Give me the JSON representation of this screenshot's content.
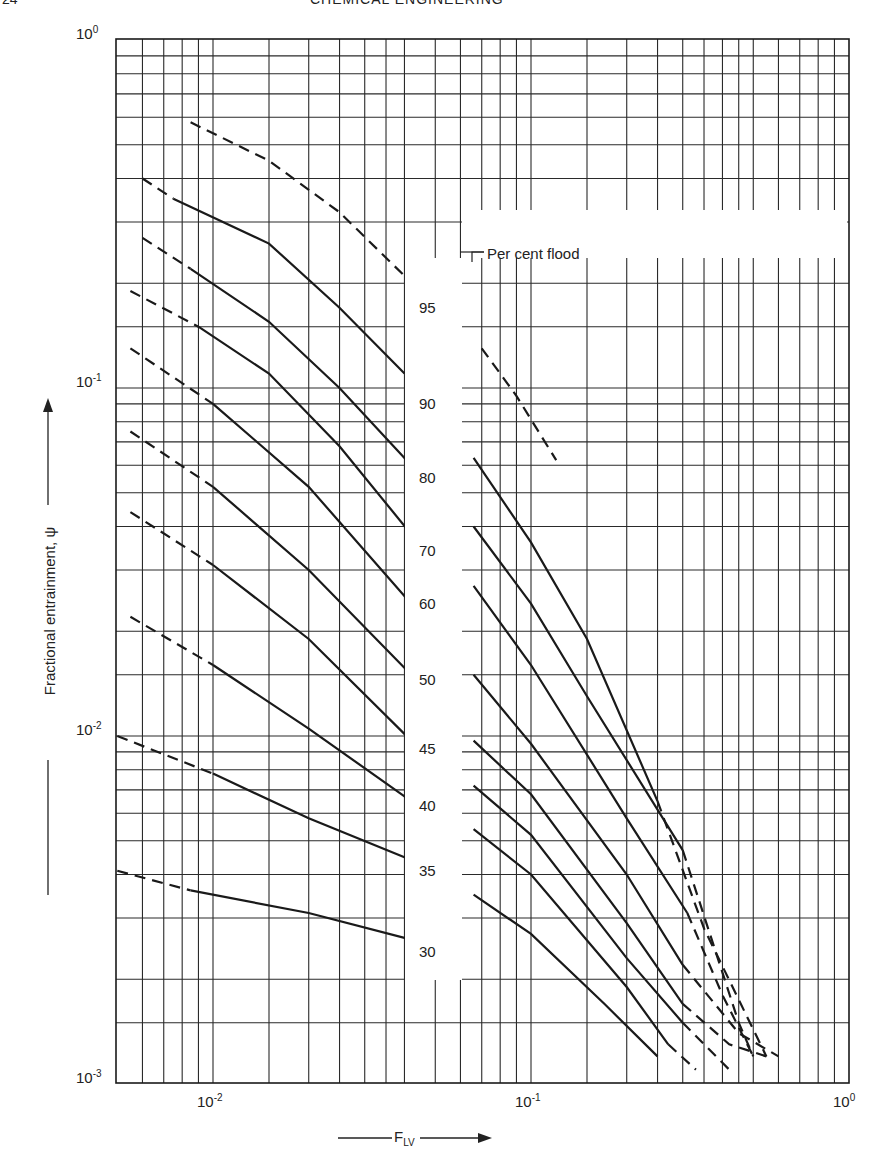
{
  "header": {
    "page_number": "24",
    "running_title": "CHEMICAL ENGINEERING"
  },
  "chart_data": {
    "type": "line",
    "title": "",
    "xlabel": "F_LV",
    "ylabel": "Fractional entrainment, ψ",
    "xscale": "log",
    "yscale": "log",
    "xlim": [
      0.005,
      1.0
    ],
    "ylim": [
      0.001,
      1.0
    ],
    "x_tick_labels": [
      "10^-2",
      "10^-1",
      "10^0"
    ],
    "y_tick_labels": [
      "10^0",
      "10^-1",
      "10^-2",
      "10^-3"
    ],
    "grid": true,
    "legend_title": "Per cent flood",
    "series": [
      {
        "name": "95",
        "segments": [
          {
            "style": "dashed",
            "points": [
              [
                0.0085,
                0.58
              ],
              [
                0.015,
                0.45
              ],
              [
                0.025,
                0.32
              ],
              [
                0.04,
                0.21
              ]
            ]
          },
          {
            "style": "dashed",
            "points": [
              [
                0.07,
                0.13
              ],
              [
                0.09,
                0.095
              ],
              [
                0.12,
                0.062
              ]
            ]
          }
        ]
      },
      {
        "name": "90",
        "segments": [
          {
            "style": "dashed",
            "points": [
              [
                0.006,
                0.4
              ],
              [
                0.0075,
                0.35
              ]
            ]
          },
          {
            "style": "solid",
            "points": [
              [
                0.0075,
                0.35
              ],
              [
                0.015,
                0.26
              ],
              [
                0.025,
                0.17
              ],
              [
                0.04,
                0.11
              ]
            ]
          }
        ]
      },
      {
        "name": "80",
        "segments": [
          {
            "style": "dashed",
            "points": [
              [
                0.006,
                0.27
              ],
              [
                0.0085,
                0.22
              ]
            ]
          },
          {
            "style": "solid",
            "points": [
              [
                0.0085,
                0.22
              ],
              [
                0.015,
                0.155
              ],
              [
                0.025,
                0.1
              ],
              [
                0.042,
                0.06
              ]
            ]
          },
          {
            "style": "solid",
            "points": [
              [
                0.066,
                0.063
              ],
              [
                0.1,
                0.036
              ],
              [
                0.15,
                0.019
              ],
              [
                0.25,
                0.0065
              ]
            ]
          },
          {
            "style": "dashed",
            "points": [
              [
                0.25,
                0.0065
              ],
              [
                0.35,
                0.0028
              ],
              [
                0.55,
                0.0012
              ]
            ]
          }
        ]
      },
      {
        "name": "70",
        "segments": [
          {
            "style": "dashed",
            "points": [
              [
                0.0055,
                0.19
              ],
              [
                0.009,
                0.15
              ]
            ]
          },
          {
            "style": "solid",
            "points": [
              [
                0.009,
                0.15
              ],
              [
                0.015,
                0.11
              ],
              [
                0.025,
                0.068
              ],
              [
                0.042,
                0.038
              ]
            ]
          },
          {
            "style": "solid",
            "points": [
              [
                0.066,
                0.04
              ],
              [
                0.1,
                0.024
              ],
              [
                0.15,
                0.013
              ],
              [
                0.3,
                0.0047
              ]
            ]
          },
          {
            "style": "dashed",
            "points": [
              [
                0.3,
                0.0047
              ],
              [
                0.45,
                0.0015
              ],
              [
                0.5,
                0.0012
              ]
            ]
          }
        ]
      },
      {
        "name": "60",
        "segments": [
          {
            "style": "dashed",
            "points": [
              [
                0.0055,
                0.13
              ],
              [
                0.01,
                0.09
              ]
            ]
          },
          {
            "style": "solid",
            "points": [
              [
                0.01,
                0.09
              ],
              [
                0.02,
                0.052
              ],
              [
                0.042,
                0.024
              ]
            ]
          },
          {
            "style": "solid",
            "points": [
              [
                0.066,
                0.027
              ],
              [
                0.1,
                0.016
              ],
              [
                0.2,
                0.0058
              ],
              [
                0.31,
                0.0031
              ]
            ]
          },
          {
            "style": "dashed",
            "points": [
              [
                0.31,
                0.0031
              ],
              [
                0.4,
                0.0018
              ],
              [
                0.5,
                0.0012
              ]
            ]
          }
        ]
      },
      {
        "name": "50",
        "segments": [
          {
            "style": "dashed",
            "points": [
              [
                0.0055,
                0.075
              ],
              [
                0.01,
                0.052
              ]
            ]
          },
          {
            "style": "solid",
            "points": [
              [
                0.01,
                0.052
              ],
              [
                0.02,
                0.03
              ],
              [
                0.042,
                0.015
              ]
            ]
          },
          {
            "style": "solid",
            "points": [
              [
                0.066,
                0.015
              ],
              [
                0.1,
                0.0095
              ],
              [
                0.2,
                0.004
              ],
              [
                0.3,
                0.0022
              ]
            ]
          },
          {
            "style": "dashed",
            "points": [
              [
                0.3,
                0.0022
              ],
              [
                0.45,
                0.0014
              ],
              [
                0.6,
                0.0012
              ]
            ]
          }
        ]
      },
      {
        "name": "45",
        "segments": [
          {
            "style": "dashed",
            "points": [
              [
                0.0055,
                0.044
              ],
              [
                0.01,
                0.031
              ]
            ]
          },
          {
            "style": "solid",
            "points": [
              [
                0.01,
                0.031
              ],
              [
                0.02,
                0.019
              ],
              [
                0.042,
                0.0097
              ]
            ]
          },
          {
            "style": "solid",
            "points": [
              [
                0.066,
                0.0097
              ],
              [
                0.1,
                0.0068
              ],
              [
                0.2,
                0.0029
              ],
              [
                0.3,
                0.0017
              ]
            ]
          },
          {
            "style": "dashed",
            "points": [
              [
                0.3,
                0.0017
              ],
              [
                0.42,
                0.0013
              ],
              [
                0.55,
                0.0012
              ]
            ]
          }
        ]
      },
      {
        "name": "40",
        "segments": [
          {
            "style": "dashed",
            "points": [
              [
                0.0055,
                0.022
              ],
              [
                0.01,
                0.016
              ]
            ]
          },
          {
            "style": "solid",
            "points": [
              [
                0.01,
                0.016
              ],
              [
                0.02,
                0.0105
              ],
              [
                0.042,
                0.0065
              ]
            ]
          },
          {
            "style": "solid",
            "points": [
              [
                0.066,
                0.0072
              ],
              [
                0.1,
                0.0052
              ],
              [
                0.2,
                0.0023
              ],
              [
                0.3,
                0.0015
              ]
            ]
          },
          {
            "style": "dashed",
            "points": [
              [
                0.3,
                0.0015
              ],
              [
                0.42,
                0.0011
              ]
            ]
          }
        ]
      },
      {
        "name": "35",
        "segments": [
          {
            "style": "dashed",
            "points": [
              [
                0.005,
                0.01
              ],
              [
                0.01,
                0.0078
              ]
            ]
          },
          {
            "style": "solid",
            "points": [
              [
                0.01,
                0.0078
              ],
              [
                0.02,
                0.0058
              ],
              [
                0.042,
                0.0044
              ]
            ]
          },
          {
            "style": "solid",
            "points": [
              [
                0.066,
                0.0054
              ],
              [
                0.1,
                0.004
              ],
              [
                0.2,
                0.0019
              ],
              [
                0.27,
                0.0013
              ]
            ]
          },
          {
            "style": "dashed",
            "points": [
              [
                0.27,
                0.0013
              ],
              [
                0.33,
                0.0011
              ]
            ]
          }
        ]
      },
      {
        "name": "30",
        "segments": [
          {
            "style": "dashed",
            "points": [
              [
                0.005,
                0.0041
              ],
              [
                0.0085,
                0.0036
              ]
            ]
          },
          {
            "style": "solid",
            "points": [
              [
                0.0085,
                0.0036
              ],
              [
                0.02,
                0.0031
              ],
              [
                0.042,
                0.0026
              ]
            ]
          },
          {
            "style": "solid",
            "points": [
              [
                0.066,
                0.0035
              ],
              [
                0.1,
                0.0027
              ],
              [
                0.17,
                0.0017
              ],
              [
                0.25,
                0.0012
              ]
            ]
          }
        ]
      }
    ]
  },
  "labels": {
    "x_ticks": [
      {
        "base": "10",
        "exp": "-2",
        "value": 0.01
      },
      {
        "base": "10",
        "exp": "-1",
        "value": 0.1
      },
      {
        "base": "10",
        "exp": "0",
        "value": 1
      }
    ],
    "y_ticks": [
      {
        "base": "10",
        "exp": "0",
        "value": 1
      },
      {
        "base": "10",
        "exp": "-1",
        "value": 0.1
      },
      {
        "base": "10",
        "exp": "-2",
        "value": 0.01
      },
      {
        "base": "10",
        "exp": "-3",
        "value": 0.001
      }
    ],
    "y_axis": "Fractional entrainment, ψ",
    "x_axis_main": "F",
    "x_axis_sub": "LV",
    "flood_title": "Per cent flood",
    "flood_values": [
      {
        "text": "95",
        "psi": 0.17
      },
      {
        "text": "90",
        "psi": 0.09
      },
      {
        "text": "80",
        "psi": 0.055
      },
      {
        "text": "70",
        "psi": 0.034
      },
      {
        "text": "60",
        "psi": 0.024
      },
      {
        "text": "50",
        "psi": 0.0145
      },
      {
        "text": "45",
        "psi": 0.0092
      },
      {
        "text": "40",
        "psi": 0.0063
      },
      {
        "text": "35",
        "psi": 0.0041
      },
      {
        "text": "30",
        "psi": 0.0024
      }
    ]
  },
  "colors": {
    "line": "#1a1a1a",
    "grid": "#2a2a2a",
    "background": "#ffffff"
  }
}
